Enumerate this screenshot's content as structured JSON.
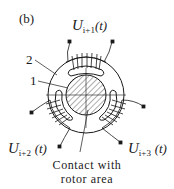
{
  "panel_label": "(b)",
  "part_labels": {
    "stator": "2",
    "rotor": "1"
  },
  "voltages": [
    {
      "symbol": "U",
      "subscript": "i+1",
      "arg": "(t)",
      "position": "top"
    },
    {
      "symbol": "U",
      "subscript": "i+2",
      "arg": "(t)",
      "position": "bottom-left"
    },
    {
      "symbol": "U",
      "subscript": "i+3",
      "arg": "(t)",
      "position": "bottom-right"
    }
  ],
  "caption": {
    "line1": "Contact with",
    "line2": "rotor area"
  }
}
